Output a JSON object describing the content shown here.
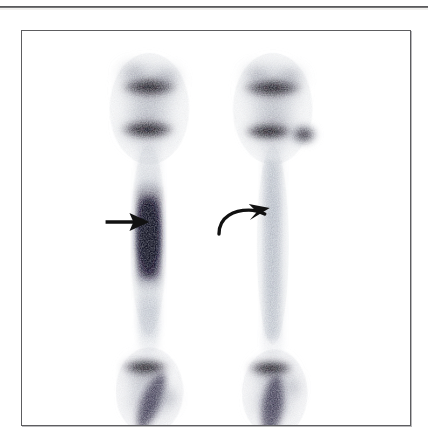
{
  "page": {
    "background_color": "#ffffff",
    "width": 428,
    "height": 439
  },
  "top_rule": {
    "name": "horizontal-rule",
    "color": "#4b4b4d"
  },
  "figure": {
    "frame_color": "#5d5d60",
    "panel_background": "#ffffff",
    "modality": "bone-scintigraphy",
    "view": "anterior lower extremities",
    "caption": "",
    "regions": [
      {
        "id": "left-knee",
        "label": "left knee",
        "uptake": "high",
        "color": "#141018"
      },
      {
        "id": "right-knee",
        "label": "right knee",
        "uptake": "high",
        "color": "#141018"
      },
      {
        "id": "left-tibia",
        "label": "left tibial shaft",
        "uptake": "focal increased",
        "color": "#1d1430"
      },
      {
        "id": "right-tibia",
        "label": "right tibial shaft",
        "uptake": "normal faint",
        "color": "#b9c2cf"
      },
      {
        "id": "left-ankle",
        "label": "left ankle",
        "uptake": "high",
        "color": "#18121e"
      },
      {
        "id": "right-ankle",
        "label": "right ankle",
        "uptake": "high",
        "color": "#18121e"
      }
    ],
    "annotations": [
      {
        "id": "straight-arrow",
        "type": "straight-arrow",
        "label": "",
        "points_to": "left-tibia",
        "color": "#111111",
        "x": 105,
        "y": 222,
        "length": 44
      },
      {
        "id": "curved-arrow",
        "type": "curved-arrow",
        "label": "",
        "points_to": "right-tibia",
        "color": "#111111",
        "x": 218,
        "y": 226,
        "length": 45
      }
    ]
  },
  "colors": {
    "ink": "#111111",
    "frame": "#5d5d60",
    "hot_spot": "#1d1430",
    "cold_tracer": "#aab4c4",
    "paper": "#ffffff"
  }
}
